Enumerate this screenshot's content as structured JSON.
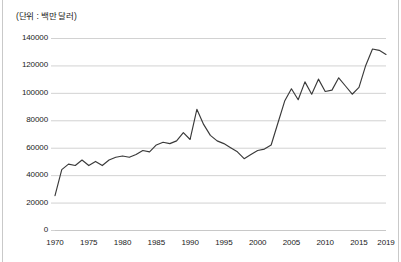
{
  "chart_data": {
    "type": "line",
    "title": "",
    "subtitle": "",
    "unit_note": "(단위 : 백만 달러)",
    "xlabel": "",
    "ylabel": "",
    "xlim": [
      1970,
      2019
    ],
    "ylim": [
      0,
      140000
    ],
    "grid": true,
    "grid_axis": "y",
    "legend": false,
    "legend_position": "none",
    "line_color": "#3a3a3a",
    "grid_color": "#d2d2d2",
    "axis_color": "#c8c8c8",
    "ytick_labels": [
      "140000",
      "120000",
      "100000",
      "80000",
      "60000",
      "40000",
      "20000",
      "0"
    ],
    "ytick_values": [
      140000,
      120000,
      100000,
      80000,
      60000,
      40000,
      20000,
      0
    ],
    "xtick_labels": [
      "1970",
      "1975",
      "1980",
      "1985",
      "1990",
      "1995",
      "2000",
      "2005",
      "2010",
      "2015",
      "2019"
    ],
    "xtick_values": [
      1970,
      1975,
      1980,
      1985,
      1990,
      1995,
      2000,
      2005,
      2010,
      2015,
      2019
    ],
    "x": [
      1970,
      1971,
      1972,
      1973,
      1974,
      1975,
      1976,
      1977,
      1978,
      1979,
      1980,
      1981,
      1982,
      1983,
      1984,
      1985,
      1986,
      1987,
      1988,
      1989,
      1990,
      1991,
      1992,
      1993,
      1994,
      1995,
      1996,
      1997,
      1998,
      1999,
      2000,
      2001,
      2002,
      2003,
      2004,
      2005,
      2006,
      2007,
      2008,
      2009,
      2010,
      2011,
      2012,
      2013,
      2014,
      2015,
      2016,
      2017,
      2018,
      2019
    ],
    "values": [
      25000,
      44000,
      48000,
      47000,
      51000,
      47000,
      50000,
      47000,
      51000,
      53000,
      54000,
      53000,
      55000,
      58000,
      57000,
      62000,
      64000,
      63000,
      65000,
      71000,
      66000,
      88000,
      77000,
      69000,
      65000,
      63000,
      60000,
      57000,
      52000,
      55000,
      58000,
      59000,
      62000,
      78000,
      94000,
      103000,
      95000,
      108000,
      99000,
      110000,
      101000,
      102000,
      111000,
      105000,
      99000,
      104000,
      120000,
      132000,
      131000,
      128000
    ],
    "series": [
      {
        "name": "",
        "values": [
          25000,
          44000,
          48000,
          47000,
          51000,
          47000,
          50000,
          47000,
          51000,
          53000,
          54000,
          53000,
          55000,
          58000,
          57000,
          62000,
          64000,
          63000,
          65000,
          71000,
          66000,
          88000,
          77000,
          69000,
          65000,
          63000,
          60000,
          57000,
          52000,
          55000,
          58000,
          59000,
          62000,
          78000,
          94000,
          103000,
          95000,
          108000,
          99000,
          110000,
          101000,
          102000,
          111000,
          105000,
          99000,
          104000,
          120000,
          132000,
          131000,
          128000
        ]
      }
    ],
    "annotations": []
  }
}
